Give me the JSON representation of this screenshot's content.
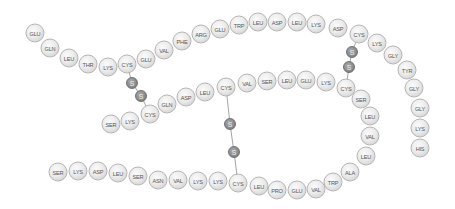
{
  "diagram": {
    "title": "",
    "residue_color": "#e6e6e6",
    "sulfur_color": "#8a8a8a",
    "chain_a": [
      {
        "label": "GLU",
        "x": 35,
        "y": 33
      },
      {
        "label": "GLN",
        "x": 50,
        "y": 48
      },
      {
        "label": "LEU",
        "x": 69,
        "y": 58
      },
      {
        "label": "THR",
        "x": 88,
        "y": 64
      },
      {
        "label": "LYS",
        "x": 108,
        "y": 67
      },
      {
        "label": "CYS",
        "x": 127,
        "y": 64
      },
      {
        "label": "GLU",
        "x": 146,
        "y": 59
      },
      {
        "label": "VAL",
        "x": 164,
        "y": 50
      },
      {
        "label": "PHE",
        "x": 182,
        "y": 41
      },
      {
        "label": "ARG",
        "x": 201,
        "y": 34
      },
      {
        "label": "GLU",
        "x": 220,
        "y": 29
      },
      {
        "label": "TRP",
        "x": 239,
        "y": 25
      },
      {
        "label": "LEU",
        "x": 258,
        "y": 22
      },
      {
        "label": "ASP",
        "x": 277,
        "y": 22
      },
      {
        "label": "LEU",
        "x": 297,
        "y": 22
      },
      {
        "label": "LYS",
        "x": 316,
        "y": 24
      },
      {
        "label": "ASP",
        "x": 338,
        "y": 28
      },
      {
        "label": "CYS",
        "x": 359,
        "y": 34
      },
      {
        "label": "LYS",
        "x": 377,
        "y": 43
      },
      {
        "label": "GLY",
        "x": 393,
        "y": 55
      },
      {
        "label": "TYR",
        "x": 407,
        "y": 70
      },
      {
        "label": "GLY",
        "x": 414,
        "y": 88
      },
      {
        "label": "GLY",
        "x": 420,
        "y": 108
      },
      {
        "label": "LYS",
        "x": 420,
        "y": 128
      },
      {
        "label": "HIS",
        "x": 420,
        "y": 148
      }
    ],
    "chain_b": [
      {
        "label": "SER",
        "x": 111,
        "y": 124
      },
      {
        "label": "LYS",
        "x": 130,
        "y": 121
      },
      {
        "label": "CYS",
        "x": 150,
        "y": 114
      },
      {
        "label": "GLN",
        "x": 167,
        "y": 104
      },
      {
        "label": "ASP",
        "x": 186,
        "y": 97
      },
      {
        "label": "LEU",
        "x": 205,
        "y": 92
      },
      {
        "label": "CYS",
        "x": 226,
        "y": 87
      },
      {
        "label": "VAL",
        "x": 247,
        "y": 83
      },
      {
        "label": "SER",
        "x": 267,
        "y": 81
      },
      {
        "label": "LEU",
        "x": 287,
        "y": 80
      },
      {
        "label": "GLU",
        "x": 306,
        "y": 80
      },
      {
        "label": "LYS",
        "x": 326,
        "y": 82
      },
      {
        "label": "CYS",
        "x": 346,
        "y": 88
      },
      {
        "label": "SER",
        "x": 361,
        "y": 99
      },
      {
        "label": "LEU",
        "x": 370,
        "y": 116
      },
      {
        "label": "VAL",
        "x": 370,
        "y": 136
      },
      {
        "label": "LEU",
        "x": 366,
        "y": 156
      },
      {
        "label": "ALA",
        "x": 350,
        "y": 172
      },
      {
        "label": "TRP",
        "x": 333,
        "y": 182
      },
      {
        "label": "VAL",
        "x": 316,
        "y": 189
      },
      {
        "label": "GLU",
        "x": 297,
        "y": 190
      },
      {
        "label": "PRO",
        "x": 277,
        "y": 190
      },
      {
        "label": "LEU",
        "x": 259,
        "y": 186
      },
      {
        "label": "CYS",
        "x": 238,
        "y": 183
      },
      {
        "label": "LYS",
        "x": 218,
        "y": 181
      },
      {
        "label": "LYS",
        "x": 198,
        "y": 181
      },
      {
        "label": "VAL",
        "x": 178,
        "y": 180
      },
      {
        "label": "ASN",
        "x": 158,
        "y": 180
      },
      {
        "label": "SER",
        "x": 138,
        "y": 176
      },
      {
        "label": "LEU",
        "x": 118,
        "y": 173
      },
      {
        "label": "ASP",
        "x": 98,
        "y": 171
      },
      {
        "label": "LYS",
        "x": 78,
        "y": 171
      },
      {
        "label": "SER",
        "x": 58,
        "y": 172
      }
    ],
    "disulfide_bridges": [
      {
        "from": {
          "x": 127,
          "y": 64
        },
        "s1": {
          "x": 132,
          "y": 83,
          "label": "S"
        },
        "s2": {
          "x": 141,
          "y": 96,
          "label": "S"
        },
        "to": {
          "x": 150,
          "y": 114
        }
      },
      {
        "from": {
          "x": 359,
          "y": 34
        },
        "s1": {
          "x": 352,
          "y": 52,
          "label": "S"
        },
        "s2": {
          "x": 349,
          "y": 67,
          "label": "S"
        },
        "to": {
          "x": 346,
          "y": 88
        }
      },
      {
        "from": {
          "x": 226,
          "y": 87
        },
        "s1": {
          "x": 230,
          "y": 124,
          "label": "S"
        },
        "s2": {
          "x": 234,
          "y": 152,
          "label": "S"
        },
        "to": {
          "x": 238,
          "y": 183
        }
      }
    ]
  }
}
